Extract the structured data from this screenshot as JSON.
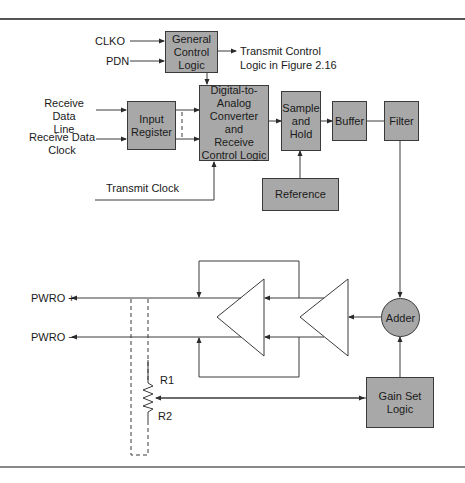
{
  "diagram": {
    "inputs": {
      "clko": "CLKO",
      "pdn": "PDN",
      "receive_data_line": "Receive Data\nLine",
      "receive_data_clock": "Receive Data\nClock",
      "transmit_clock": "Transmit Clock"
    },
    "outputs": {
      "transmit_control": "Transmit Control\nLogic in Figure 2.16",
      "pwro_plus": "PWRO +",
      "pwro_minus": "PWRO −"
    },
    "blocks": {
      "general_control_logic": "General\nControl\nLogic",
      "input_register": "Input\nRegister",
      "dac": "Digital-to-\nAnalog\nConverter and\nReceive\nControl Logic",
      "sample_and_hold": "Sample\nand\nHold",
      "buffer": "Buffer",
      "filter": "Filter",
      "reference": "Reference",
      "adder": "Adder",
      "gain_set_logic": "Gain Set\nLogic"
    },
    "resistor": {
      "r1": "R1",
      "r2": "R2"
    },
    "colors": {
      "block_fill": "#a8a8a8",
      "line": "#3a3a3a",
      "rule": "#555555"
    }
  }
}
